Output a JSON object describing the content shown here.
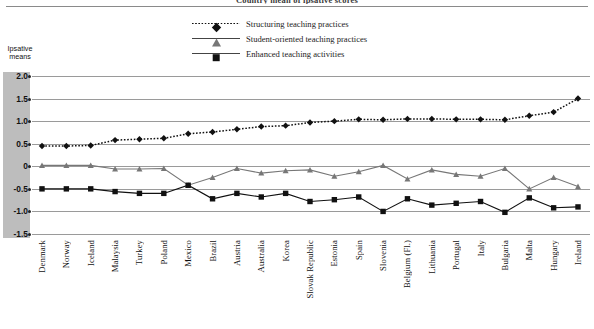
{
  "title": "Country mean of ipsative scores",
  "yaxis": {
    "title_line1": "Ipsative",
    "title_line2": "means",
    "ticks": [
      "2.0",
      "1.5",
      "1.0",
      "0.5",
      "0",
      "-0.5",
      "-1.0",
      "-1.5"
    ]
  },
  "legend": {
    "items": [
      {
        "label": "Structuring teaching practices",
        "marker": "diamond-marker",
        "style": "dotted",
        "color": "#111111"
      },
      {
        "label": "Student-oriented teaching practices",
        "marker": "triangle-marker",
        "style": "solid",
        "color": "#777777"
      },
      {
        "label": "Enhanced teaching activities",
        "marker": "square-marker",
        "style": "solid",
        "color": "#111111"
      }
    ]
  },
  "chart_data": {
    "type": "line",
    "title": "Country mean of ipsative scores",
    "xlabel": "",
    "ylabel": "Ipsative means",
    "ylim": [
      -1.5,
      2.0
    ],
    "ytick_step": 0.5,
    "grid": true,
    "legend_position": "top-center",
    "categories": [
      "Denmark",
      "Norway",
      "Iceland",
      "Malaysia",
      "Turkey",
      "Poland",
      "Mexico",
      "Brazil",
      "Austria",
      "Australia",
      "Korea",
      "Slovak Republic",
      "Estonia",
      "Spain",
      "Slovenia",
      "Belgium (Fl.)",
      "Lithuania",
      "Portugal",
      "Italy",
      "Bulgaria",
      "Malta",
      "Hungary",
      "Ireland"
    ],
    "series": [
      {
        "name": "Structuring teaching practices",
        "marker": "diamond",
        "style": "dotted",
        "color": "#111111",
        "values": [
          0.45,
          0.45,
          0.46,
          0.58,
          0.6,
          0.62,
          0.72,
          0.76,
          0.82,
          0.88,
          0.9,
          0.97,
          1.0,
          1.04,
          1.03,
          1.05,
          1.05,
          1.04,
          1.04,
          1.03,
          1.12,
          1.2,
          1.5
        ]
      },
      {
        "name": "Student-oriented teaching practices",
        "marker": "triangle",
        "style": "solid",
        "color": "#777777",
        "values": [
          0.02,
          0.02,
          0.02,
          -0.06,
          -0.06,
          -0.05,
          -0.42,
          -0.25,
          -0.05,
          -0.15,
          -0.1,
          -0.08,
          -0.22,
          -0.12,
          0.02,
          -0.28,
          -0.08,
          -0.18,
          -0.22,
          -0.05,
          -0.5,
          -0.25,
          -0.45
        ]
      },
      {
        "name": "Enhanced teaching activities",
        "marker": "square",
        "style": "solid",
        "color": "#111111",
        "values": [
          -0.5,
          -0.5,
          -0.5,
          -0.56,
          -0.6,
          -0.6,
          -0.42,
          -0.72,
          -0.6,
          -0.68,
          -0.6,
          -0.78,
          -0.74,
          -0.68,
          -1.0,
          -0.72,
          -0.86,
          -0.82,
          -0.78,
          -1.02,
          -0.7,
          -0.92,
          -0.9
        ]
      }
    ]
  }
}
